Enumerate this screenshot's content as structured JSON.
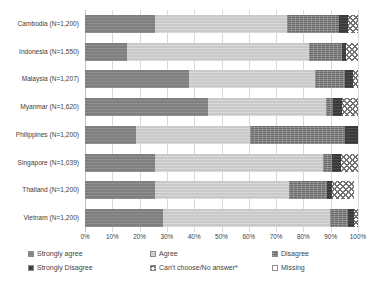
{
  "chart_data": {
    "type": "bar",
    "subtype": "stacked-horizontal-100pct",
    "title": "",
    "xlabel": "",
    "ylabel": "",
    "xlim": [
      0,
      100
    ],
    "xtick_labels": [
      "0%",
      "10%",
      "20%",
      "30%",
      "40%",
      "50%",
      "60%",
      "70%",
      "80%",
      "90%",
      "100%"
    ],
    "xtick_values": [
      0,
      10,
      20,
      30,
      40,
      50,
      60,
      70,
      80,
      90,
      100
    ],
    "grid": true,
    "legend_position": "bottom",
    "categories": [
      "Cambodia (N=1,200)",
      "Indonesia (N=1,550)",
      "Malaysia (N=1,207)",
      "Myanmar (N=1,620)",
      "Philippines (N=1,200)",
      "Singapore (N=1,039)",
      "Thailand (N=1,200)",
      "Vietnam (N=1,200)"
    ],
    "series": [
      {
        "name": "Strongly agree",
        "key": "strongly-agree",
        "values": [
          25.6,
          15.4,
          38.1,
          45.1,
          18.7,
          25.6,
          25.6,
          28.6
        ]
      },
      {
        "name": "Agree",
        "key": "agree",
        "values": [
          48.4,
          66.7,
          46.2,
          43.2,
          41.7,
          61.5,
          49.1,
          61.2
        ]
      },
      {
        "name": "Disagree",
        "key": "disagree",
        "values": [
          19.0,
          12.1,
          11.0,
          2.6,
          34.8,
          3.3,
          13.9,
          6.6
        ]
      },
      {
        "name": "Strongly Disagree",
        "key": "strongly-disagree",
        "values": [
          3.3,
          1.5,
          2.9,
          3.3,
          4.8,
          3.3,
          1.8,
          2.2
        ]
      },
      {
        "name": "Can't choose/No answer*",
        "key": "cant-choose",
        "values": [
          3.7,
          4.3,
          1.8,
          5.8,
          0.0,
          6.3,
          8.1,
          1.4
        ]
      },
      {
        "name": "Missing",
        "key": "missing",
        "values": [
          0.0,
          0.0,
          0.0,
          0.0,
          0.0,
          0.0,
          1.5,
          0.0
        ]
      }
    ]
  },
  "legend": {
    "items": [
      {
        "label": "Strongly agree",
        "key": "strongly-agree"
      },
      {
        "label": "Agree",
        "key": "agree"
      },
      {
        "label": "Disagree",
        "key": "disagree"
      },
      {
        "label": "Strongly Disagree",
        "key": "strongly-disagree"
      },
      {
        "label": "Can't choose/No answer*",
        "key": "cant-choose"
      },
      {
        "label": "Missing",
        "key": "missing"
      }
    ]
  }
}
